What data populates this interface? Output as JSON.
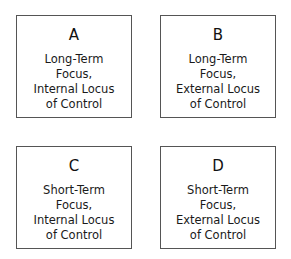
{
  "quadrants": [
    {
      "letter": "A",
      "lines": [
        "Long-Term",
        "Focus,",
        "Internal Locus",
        "of Control"
      ]
    },
    {
      "letter": "B",
      "lines": [
        "Long-Term",
        "Focus,",
        "External Locus",
        "of Control"
      ]
    },
    {
      "letter": "C",
      "lines": [
        "Short-Term",
        "Focus,",
        "Internal Locus",
        "of Control"
      ]
    },
    {
      "letter": "D",
      "lines": [
        "Short-Term",
        "Focus,",
        "External Locus",
        "of Control"
      ]
    }
  ],
  "colors": {
    "border": "#555555",
    "text": "#1a1a1a",
    "background": "#ffffff"
  }
}
